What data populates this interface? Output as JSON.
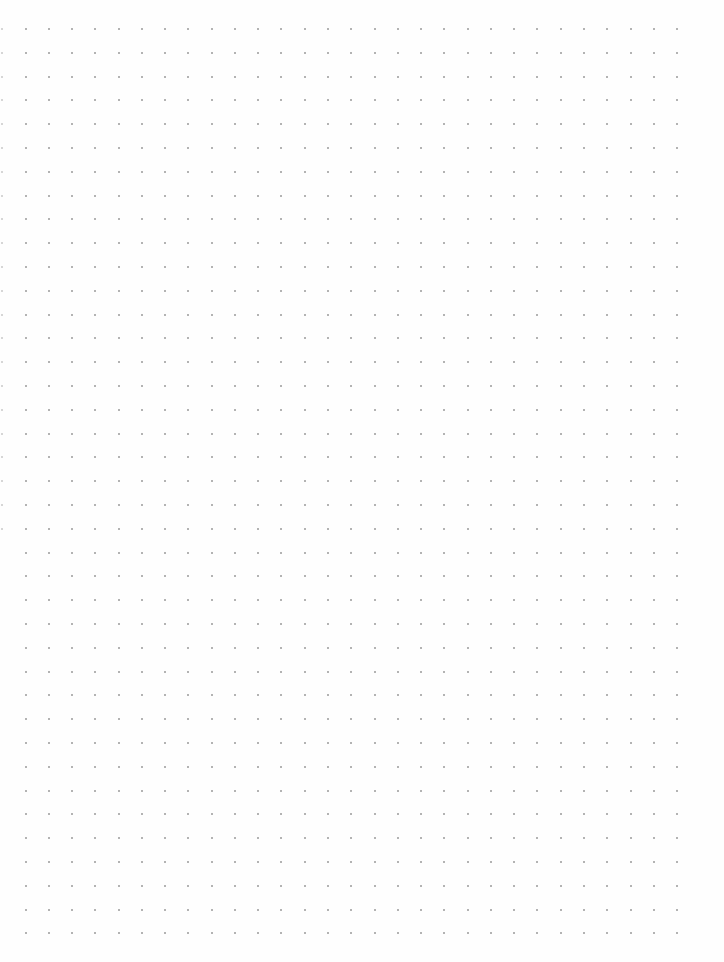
{
  "page": {
    "type": "dot-grid-paper",
    "background_color": "#fefefe",
    "dot_color": "#9a9a9a",
    "edge_dot_color": "#c8c8c8"
  },
  "grid": {
    "columns": 29,
    "rows": 39,
    "origin_x": 25.5,
    "origin_y": 29,
    "spacing_x": 23.27,
    "spacing_y": 23.8,
    "dot_size": 2,
    "edge_column_x": 2,
    "edge_column_rows": 22
  }
}
